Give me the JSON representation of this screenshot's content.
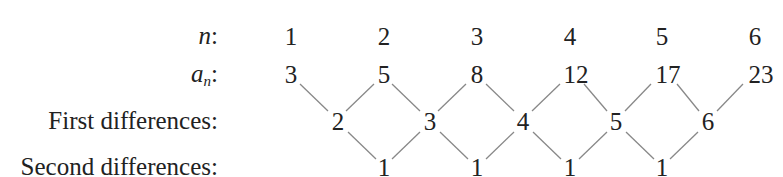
{
  "labels": {
    "n": "n",
    "a": "a",
    "a_sub": "n",
    "colon": ":",
    "first": "First differences:",
    "second": "Second differences:"
  },
  "n_values": [
    "1",
    "2",
    "3",
    "4",
    "5",
    "6"
  ],
  "a_values": [
    "3",
    "5",
    "8",
    "12",
    "17",
    "23"
  ],
  "first_differences": [
    "2",
    "3",
    "4",
    "5",
    "6"
  ],
  "second_differences": [
    "1",
    "1",
    "1",
    "1"
  ],
  "line_color": "#888888"
}
